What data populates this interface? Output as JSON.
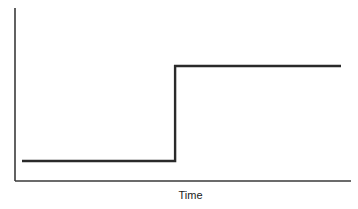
{
  "chart_data": {
    "type": "line",
    "title": "",
    "xlabel": "Time",
    "ylabel": "",
    "grid": false,
    "legend": null,
    "x": [
      0.0,
      0.48,
      0.48,
      1.0
    ],
    "series": [
      {
        "name": "signal",
        "values": [
          0.15,
          0.15,
          0.85,
          0.85
        ]
      }
    ],
    "xlim": [
      0,
      1
    ],
    "ylim": [
      0,
      1
    ]
  },
  "colors": {
    "axis": "#3a3a3a",
    "series": "#2a2a2a",
    "background": "#ffffff"
  }
}
